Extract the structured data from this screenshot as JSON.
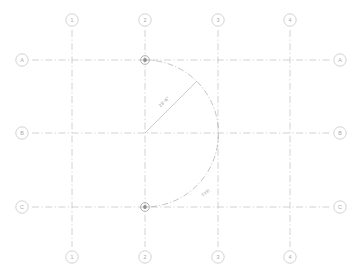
{
  "drawing": {
    "title": "Architectural Column Grid Plan",
    "background_color": "#ffffff",
    "line_color": "#b9b9be",
    "arc_color": "#a9a9b0",
    "text_color": "#a8a8af",
    "node_color": "#8f8f97"
  },
  "grid": {
    "columns": [
      {
        "label": "1",
        "x": 72
      },
      {
        "label": "2",
        "x": 145
      },
      {
        "label": "3",
        "x": 218
      },
      {
        "label": "4",
        "x": 290
      }
    ],
    "rows": [
      {
        "label": "A",
        "y": 60
      },
      {
        "label": "B",
        "y": 133
      },
      {
        "label": "C",
        "y": 207
      }
    ],
    "extent": {
      "left": 32,
      "right": 330,
      "top": 30,
      "bottom": 247
    }
  },
  "bubbles": {
    "radius": 6.2,
    "top_y": 20,
    "bottom_y": 257,
    "left_x": 22,
    "right_x": 340,
    "column_labels_top": [
      "1",
      "2",
      "3",
      "4"
    ],
    "column_labels_bottom": [
      "1",
      "2",
      "3",
      "4"
    ],
    "row_labels_left": [
      "A",
      "B",
      "C"
    ],
    "row_labels_right": [
      "A",
      "B",
      "C"
    ]
  },
  "arc": {
    "center_grid": "2/B",
    "center_x": 145,
    "center_y": 133,
    "radius": 73,
    "start_grid": "2/A",
    "end_grid": "2/C",
    "tangent_grid": "3/B",
    "description": "Semicircular dash-dot arc from grid 2/A through 3/B to grid 2/C"
  },
  "nodes": [
    {
      "name": "arc-start-node",
      "grid": "2/A",
      "x": 145,
      "y": 60
    },
    {
      "name": "arc-end-node",
      "grid": "2/C",
      "x": 145,
      "y": 207
    }
  ],
  "annotations": {
    "radius_dimension": {
      "text": "28'-6\"",
      "x": 165,
      "y": 103,
      "rotation": -45
    },
    "typical_note": {
      "text": "TYP.",
      "x": 207,
      "y": 194,
      "rotation": -38
    }
  }
}
